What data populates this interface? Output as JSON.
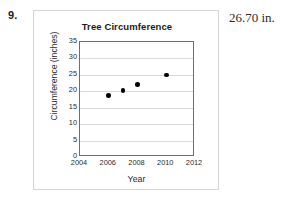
{
  "problem": {
    "number": "9.",
    "answer": "26.70 in."
  },
  "chart_data": {
    "type": "scatter",
    "title": "Tree Circumference",
    "xlabel": "Year",
    "ylabel": "Circumference (inches)",
    "xlim": [
      2004,
      2012
    ],
    "ylim": [
      0,
      35
    ],
    "xticks": [
      "2004",
      "2006",
      "2008",
      "2010",
      "2012"
    ],
    "yticks": [
      "0",
      "5",
      "10",
      "15",
      "20",
      "25",
      "30",
      "35"
    ],
    "grid": "horizontal",
    "legend": "none",
    "x": [
      2006,
      2007,
      2008,
      2010
    ],
    "values": [
      18.7,
      20.3,
      22.0,
      25.0
    ],
    "points": [
      {
        "x": 2006,
        "y": 18.7
      },
      {
        "x": 2007,
        "y": 20.3
      },
      {
        "x": 2008,
        "y": 22.0
      },
      {
        "x": 2010,
        "y": 25.0
      }
    ],
    "marker_color": "#000000",
    "grid_color": "#d9d9d9",
    "frame_color": "#6e6e6e"
  }
}
